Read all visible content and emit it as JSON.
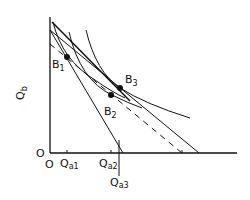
{
  "axes": {
    "y_label": "Q",
    "y_label_sub": "b",
    "origin_y_label": "O",
    "origin_x_label": "O",
    "x_ticks": [
      {
        "main": "Q",
        "sub": "a1"
      },
      {
        "main": "Q",
        "sub": "a2"
      },
      {
        "main": "Q",
        "sub": "a3"
      }
    ]
  },
  "points": [
    {
      "main": "B",
      "sub": "1"
    },
    {
      "main": "B",
      "sub": "2"
    },
    {
      "main": "B",
      "sub": "3"
    }
  ],
  "colors": {
    "ink": "#111111",
    "background": "#ffffff"
  }
}
